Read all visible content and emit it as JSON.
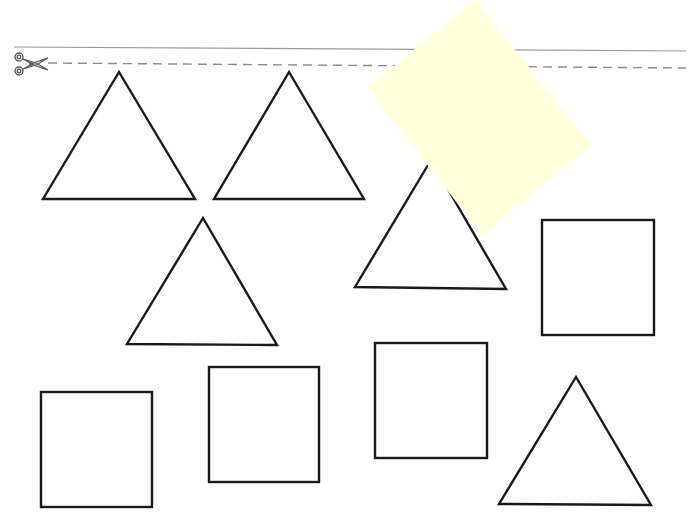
{
  "worksheet": {
    "background": "#fefefe",
    "stroke_color": "#1a1a1a",
    "cut_line": {
      "solid": {
        "x1": 14,
        "y1": 47,
        "x2": 686,
        "y2": 51
      },
      "dashed": {
        "x1": 48,
        "y1": 63,
        "x2": 686,
        "y2": 68
      },
      "icon": "scissors-icon"
    },
    "triangles": [
      {
        "points": "119,72 43,199 195,199"
      },
      {
        "points": "289,72 214,199 364,199"
      },
      {
        "points": "203,218 127,344 277,345"
      },
      {
        "points": "431,160 355,287 506,289"
      },
      {
        "points": "576,377 499,504 651,505"
      }
    ],
    "squares": [
      {
        "x": 542,
        "y": 220,
        "w": 112,
        "h": 115
      },
      {
        "x": 41,
        "y": 392,
        "w": 111,
        "h": 115
      },
      {
        "x": 209,
        "y": 367,
        "w": 110,
        "h": 115
      },
      {
        "x": 375,
        "y": 343,
        "w": 112,
        "h": 115
      }
    ],
    "sticky_note": {
      "points": "475,0 592,145 483,236 367,88",
      "color": "#ffffdc"
    }
  }
}
